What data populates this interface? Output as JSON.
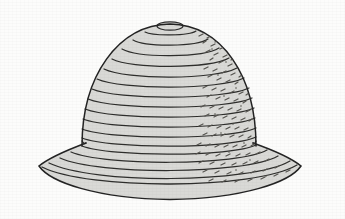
{
  "image": {
    "domain": "Natural-Image",
    "kind": "line-drawing-illustration",
    "subject_label": "bucket hat",
    "width": 345,
    "height": 219,
    "background_color": "#fcfcfb",
    "ink_color": "#2b2b2b",
    "fill_color": "#d9d9d6",
    "shading_color": "#55544f",
    "technique": "ink contour line drawing with horizontal concentric ring bands and stipple-dash hatching on the right side",
    "has_border_frame": false
  },
  "subject": {
    "name": "hat",
    "parts": [
      {
        "name": "crown-top-knob",
        "description": "small flat ellipse at the very top of the crown"
      },
      {
        "name": "crown",
        "description": "rounded dome built from stacked horizontal ring bands"
      },
      {
        "name": "crown-brim-step",
        "description": "slight notch where the dome meets the flaring brim"
      },
      {
        "name": "brim",
        "description": "wide downward-flaring brim with concentric bands"
      }
    ],
    "band_count": 20,
    "shaded_side": "right",
    "light_direction": "upper-left"
  },
  "geometry": {
    "crown_top_y": 22,
    "crown_left_x": 82,
    "crown_right_x": 256,
    "crown_bottom_y": 146,
    "brim_left_tip_x": 39,
    "brim_right_tip_x": 301,
    "brim_tip_y": 166,
    "brim_bottom_y": 199,
    "center_x": 170
  }
}
